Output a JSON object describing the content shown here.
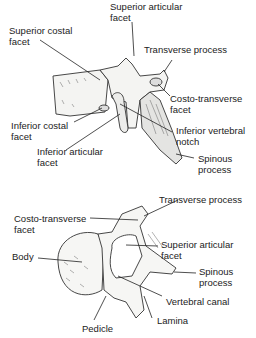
{
  "figures": [
    {
      "view": "lateral",
      "labels": [
        {
          "id": "superior-articular-facet",
          "line1": "Superior articular",
          "line2": "facet"
        },
        {
          "id": "superior-costal-facet",
          "line1": "Superior costal",
          "line2": "facet"
        },
        {
          "id": "transverse-process",
          "line1": "Transverse process",
          "line2": ""
        },
        {
          "id": "costo-transverse-facet",
          "line1": "Costo-transverse",
          "line2": "facet"
        },
        {
          "id": "inferior-costal-facet",
          "line1": "Inferior costal",
          "line2": "facet"
        },
        {
          "id": "inferior-vertebral-notch",
          "line1": "Inferior vertebral",
          "line2": "notch"
        },
        {
          "id": "inferior-articular-facet",
          "line1": "Inferior articular",
          "line2": "facet"
        },
        {
          "id": "spinous-process",
          "line1": "Spinous",
          "line2": "process"
        }
      ]
    },
    {
      "view": "superior",
      "labels": [
        {
          "id": "transverse-process",
          "line1": "Transverse process",
          "line2": ""
        },
        {
          "id": "costo-transverse-facet",
          "line1": "Costo-transverse",
          "line2": "facet"
        },
        {
          "id": "superior-articular-facet",
          "line1": "Superior articular",
          "line2": "facet"
        },
        {
          "id": "body",
          "line1": "Body",
          "line2": ""
        },
        {
          "id": "spinous-process",
          "line1": "Spinous",
          "line2": "process"
        },
        {
          "id": "vertebral-canal",
          "line1": "Vertebral canal",
          "line2": ""
        },
        {
          "id": "lamina",
          "line1": "Lamina",
          "line2": ""
        },
        {
          "id": "pedicle",
          "line1": "Pedicle",
          "line2": ""
        }
      ]
    }
  ]
}
